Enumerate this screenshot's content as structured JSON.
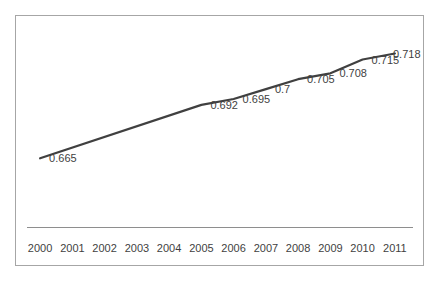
{
  "chart_data": {
    "type": "line",
    "title": "",
    "xlabel": "",
    "ylabel": "",
    "legend": false,
    "grid": false,
    "categories": [
      "2000",
      "2001",
      "2002",
      "2003",
      "2004",
      "2005",
      "2006",
      "2007",
      "2008",
      "2009",
      "2010",
      "2011"
    ],
    "series": [
      {
        "name": "",
        "values": [
          0.665,
          null,
          null,
          null,
          null,
          0.692,
          0.695,
          0.7,
          0.705,
          0.708,
          0.715,
          0.718
        ]
      }
    ],
    "data_labels": [
      "0.665",
      null,
      null,
      null,
      null,
      "0.692",
      "0.695",
      "0.7",
      "0.705",
      "0.708",
      "0.715",
      "0.718"
    ],
    "ylim": [
      0.63,
      0.738
    ],
    "colors": {
      "line": "#404040",
      "axis_line": "#8e8e8e",
      "plot_border": "#a6a6a6",
      "text": "#3f3f3f",
      "background": "#ffffff"
    }
  }
}
